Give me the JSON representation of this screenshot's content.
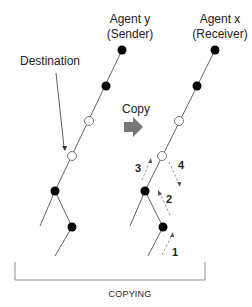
{
  "labels": {
    "sender_title": "Agent y",
    "sender_subtitle": "(Sender)",
    "receiver_title": "Agent x",
    "receiver_subtitle": "(Receiver)",
    "destination": "Destination",
    "copy": "Copy",
    "caption": "COPYING"
  },
  "steps": [
    "1",
    "2",
    "3",
    "4"
  ],
  "colors": {
    "line": "#555555",
    "node_filled": "#000000",
    "node_empty": "#ffffff",
    "arrow": "#777777"
  }
}
